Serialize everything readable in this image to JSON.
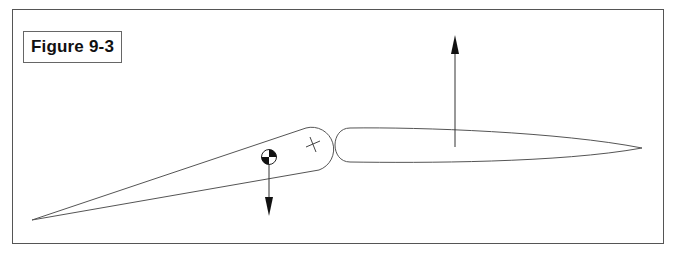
{
  "figure": {
    "label": "Figure 9-3"
  },
  "diagram": {
    "elements": [
      {
        "name": "control-surface",
        "shape": "tapered-wedge"
      },
      {
        "name": "hinge-point",
        "symbol": "cross"
      },
      {
        "name": "center-of-gravity",
        "symbol": "cg-symbol"
      },
      {
        "name": "weight-arrow",
        "direction": "down"
      },
      {
        "name": "fixed-surface",
        "shape": "elongated-ellipse"
      },
      {
        "name": "lift-arrow",
        "direction": "up"
      }
    ],
    "colors": {
      "stroke": "#555555",
      "arrow": "#222222",
      "border": "#555555"
    }
  }
}
